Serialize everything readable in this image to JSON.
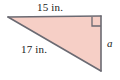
{
  "figure": {
    "kind": "right-triangle-diagram",
    "background_color": "#ffffff",
    "fill_color": "#f6cfc6",
    "edge_color": "#6b6a72",
    "text_color": "#1a1a1a",
    "labels": {
      "top_side": "15 in.",
      "hypotenuse": "17 in.",
      "vertical_side": "a"
    },
    "right_angle_marker": {
      "present": true,
      "corner": "top-right"
    },
    "vertices": {
      "left": [
        8,
        17
      ],
      "top_right": [
        101,
        16
      ],
      "bottom_right": [
        101,
        71
      ]
    }
  }
}
